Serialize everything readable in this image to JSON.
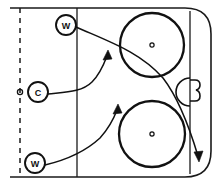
{
  "diagram": {
    "type": "hockey-rink-play",
    "rink": {
      "boundary_top_y": 8,
      "boundary_bottom_y": 177,
      "boundary_left_x": 10,
      "boundary_right_x": 211,
      "corner_radius": 26,
      "blue_line_x": 77,
      "goal_line_x": 190,
      "center_line_x": 20,
      "center_line_style": "dashed"
    },
    "center_puck": {
      "label": "puck",
      "x": 20,
      "y": 92,
      "r": 2.6
    },
    "faceoff_circles": [
      {
        "name": "top-faceoff-circle",
        "cx": 152,
        "cy": 45,
        "r": 32
      },
      {
        "name": "bottom-faceoff-circle",
        "cx": 152,
        "cy": 134,
        "r": 33
      }
    ],
    "goal": {
      "crease_label": "goal-crease",
      "crease_cx": 190,
      "crease_cy": 92,
      "crease_r": 14,
      "net_label": "goal-net"
    },
    "players": [
      {
        "id": "w1",
        "label": "W",
        "x": 66,
        "y": 25,
        "r": 10,
        "role": "Wing (top)"
      },
      {
        "id": "c1",
        "label": "C",
        "x": 38,
        "y": 92,
        "r": 10,
        "role": "Center"
      },
      {
        "id": "w2",
        "label": "W",
        "x": 35,
        "y": 163,
        "r": 10,
        "role": "Wing (bottom)"
      }
    ],
    "movement_paths": [
      {
        "id": "path-w1",
        "from": "w1",
        "to": "bottom-right-corner",
        "style": "curved-with-arrow",
        "description": "Top wing drives across toward the far corner behind the net"
      },
      {
        "id": "path-c1",
        "from": "c1",
        "to": "slot-high",
        "style": "curved-with-arrow",
        "description": "Center curls up into the high slot"
      },
      {
        "id": "path-w2",
        "from": "w2",
        "to": "slot-low",
        "style": "curved-with-arrow",
        "description": "Bottom wing swings up into the low slot"
      }
    ],
    "colors": {
      "ink": "#111111",
      "rink_surface": "#ffffff"
    }
  }
}
